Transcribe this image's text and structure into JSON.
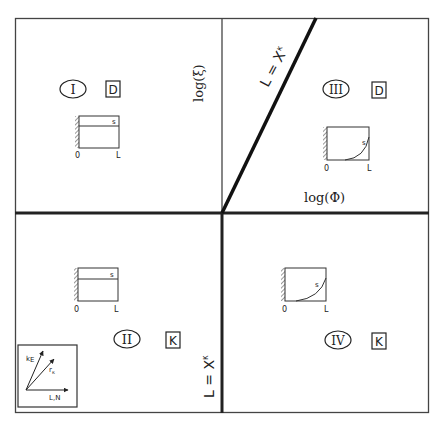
{
  "diagram": {
    "axes": {
      "vertical_axis_label": "log(ξ)",
      "horizontal_axis_label": "log(Φ)"
    },
    "boundaries": {
      "diagonal_label": "L = X",
      "diagonal_subscript": "κ",
      "vertical_label": "L = X",
      "vertical_subscript": "κ"
    },
    "quadrants": [
      {
        "id": "I",
        "numeral": "I",
        "type": "D",
        "profile": "flat",
        "profile_label": "s",
        "x0_label": "0",
        "x1_label": "L"
      },
      {
        "id": "II",
        "numeral": "II",
        "type": "K",
        "profile": "flat",
        "profile_label": "s",
        "x0_label": "0",
        "x1_label": "L"
      },
      {
        "id": "III",
        "numeral": "III",
        "type": "D",
        "profile": "curved",
        "profile_label": "s",
        "x0_label": "0",
        "x1_label": "L"
      },
      {
        "id": "IV",
        "numeral": "IV",
        "type": "K",
        "profile": "curved",
        "profile_label": "s",
        "x0_label": "0",
        "x1_label": "L"
      }
    ],
    "inset": {
      "arrow1_label": "k",
      "arrow1_sub": "E",
      "arrow2_label": "r",
      "arrow2_sub": "κ",
      "arrow3_label": "L,N"
    }
  }
}
